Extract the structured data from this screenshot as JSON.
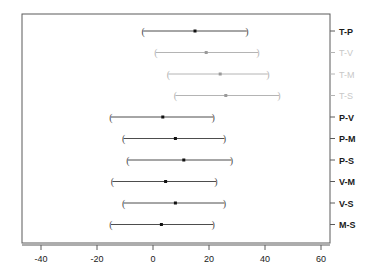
{
  "chart_data": {
    "type": "scatter",
    "title": "",
    "subtitle": "",
    "xlabel": "",
    "ylabel": "",
    "orientation": "horizontal",
    "grid": false,
    "legend": null,
    "xlim": [
      -47,
      64
    ],
    "xticks": [
      -40,
      -20,
      0,
      20,
      40,
      60
    ],
    "xtick_labels": [
      "-40",
      "-20",
      "0",
      "20",
      "40",
      "60"
    ],
    "ytick_side": "right",
    "categories": [
      "T-P",
      "T-V",
      "T-M",
      "T-S",
      "P-V",
      "P-M",
      "P-S",
      "V-M",
      "V-S",
      "M-S"
    ],
    "point_marker": "square-dot",
    "interval_marker": "parenthesis",
    "series": [
      {
        "name": "mean difference",
        "values": [
          15.0,
          19.0,
          24.0,
          26.0,
          3.5,
          8.0,
          11.0,
          4.5,
          8.0,
          3.0
        ]
      },
      {
        "name": "lower confidence limit",
        "values": [
          -3.5,
          1.0,
          5.5,
          8.0,
          -15.0,
          -10.5,
          -9.0,
          -14.5,
          -10.5,
          -15.0
        ]
      },
      {
        "name": "upper confidence limit",
        "values": [
          33.5,
          37.5,
          41.0,
          45.0,
          21.5,
          25.5,
          28.0,
          22.5,
          25.5,
          21.5
        ]
      }
    ],
    "points": [
      {
        "label": "T-P",
        "estimate": 15.0,
        "lower": -3.5,
        "upper": 33.5,
        "faded": false
      },
      {
        "label": "T-V",
        "estimate": 19.0,
        "lower": 1.0,
        "upper": 37.5,
        "faded": true
      },
      {
        "label": "T-M",
        "estimate": 24.0,
        "lower": 5.5,
        "upper": 41.0,
        "faded": true
      },
      {
        "label": "T-S",
        "estimate": 26.0,
        "lower": 8.0,
        "upper": 45.0,
        "faded": true
      },
      {
        "label": "P-V",
        "estimate": 3.5,
        "lower": -15.0,
        "upper": 21.5,
        "faded": false
      },
      {
        "label": "P-M",
        "estimate": 8.0,
        "lower": -10.5,
        "upper": 25.5,
        "faded": false
      },
      {
        "label": "P-S",
        "estimate": 11.0,
        "lower": -9.0,
        "upper": 28.0,
        "faded": false
      },
      {
        "label": "V-M",
        "estimate": 4.5,
        "lower": -14.5,
        "upper": 22.5,
        "faded": false
      },
      {
        "label": "V-S",
        "estimate": 8.0,
        "lower": -10.5,
        "upper": 25.5,
        "faded": false
      },
      {
        "label": "M-S",
        "estimate": 3.0,
        "lower": -15.0,
        "upper": 21.5,
        "faded": false
      }
    ],
    "colors": {
      "frame": "#5a5a5a",
      "interval_line": "#4d4d4d",
      "interval_line_faded": "#b4b4b4",
      "point": "#111111",
      "point_faded": "#9a9a9a",
      "tick_text": "#1a1a1a",
      "label_text": "#1a1a1a",
      "label_text_faded": "#c8c8c8",
      "background": "#ffffff"
    }
  },
  "geometry": {
    "plot_left": 22,
    "plot_right": 330,
    "plot_top": 14,
    "plot_bottom": 243,
    "x_zero_px": 153,
    "px_per_unit": 2.8,
    "row_top_px": 31,
    "row_step_px": 21.5,
    "tick_len": 5
  }
}
